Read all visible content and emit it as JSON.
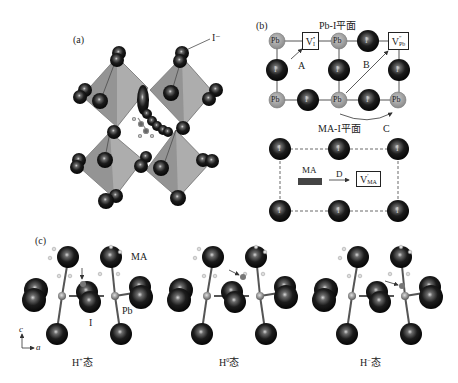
{
  "figure": {
    "panel_a": {
      "label": "(a)",
      "ion_label": "I⁻",
      "description": "Perovskite octahedral framework with migration path of iodide"
    },
    "panel_b": {
      "label": "(b)",
      "pb_i_plane": {
        "title": "Pb-I平面",
        "atoms_top_row": [
          "Pb",
          "V_I",
          "Pb",
          "I",
          "V_Pb"
        ],
        "atoms_mid_row": [
          "I",
          "I",
          "I"
        ],
        "atoms_bottom_row": [
          "Pb",
          "I",
          "Pb",
          "I",
          "Pb"
        ],
        "vacancy_i": {
          "base": "V",
          "sub": "I",
          "sup": "•"
        },
        "vacancy_pb": {
          "base": "V",
          "sub": "Pb",
          "sup": "″"
        },
        "paths": [
          "A",
          "B",
          "C"
        ]
      },
      "ma_i_plane": {
        "title": "MA-I平面",
        "ma_label": "MA",
        "path": "D",
        "vacancy_ma": {
          "base": "V",
          "sub": "MA",
          "sup": "′"
        },
        "atom_label": "I"
      }
    },
    "panel_c": {
      "label": "(c)",
      "ma_label": "MA",
      "pb_label": "Pb",
      "i_label": "I",
      "axis_c": "c",
      "axis_a": "a",
      "states": [
        {
          "base": "H",
          "sup": "+",
          "suffix": "态"
        },
        {
          "base": "H",
          "sup": "0",
          "suffix": "态"
        },
        {
          "base": "H",
          "sup": "−",
          "suffix": "态"
        }
      ]
    }
  },
  "colors": {
    "iodide": "#1a1a1a",
    "lead": "#9a9a9a",
    "octahedron": "#a8a8a8",
    "line": "#333333"
  }
}
